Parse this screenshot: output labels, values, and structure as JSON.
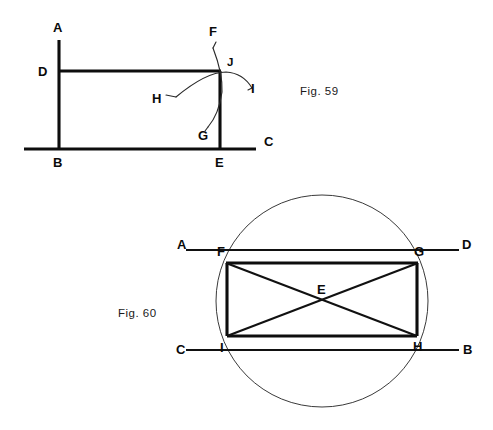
{
  "page": {
    "background_color": "#ffffff",
    "ink_color": "#0d0d0d",
    "width": 493,
    "height": 430
  },
  "figures": [
    {
      "id": "fig-59",
      "caption": "Fig. 59",
      "caption_x": 300,
      "caption_y": 95,
      "description": "Rectangle construction with two intersecting compass arcs meeting at J",
      "points": [
        {
          "key": "A",
          "label": "A",
          "x": 59,
          "y": 40,
          "label_x": 53,
          "label_y": 32
        },
        {
          "key": "B",
          "label": "B",
          "x": 59,
          "y": 149,
          "label_x": 53,
          "label_y": 167
        },
        {
          "key": "C",
          "label": "C",
          "x": 256,
          "y": 149,
          "label_x": 264,
          "label_y": 146
        },
        {
          "key": "D",
          "label": "D",
          "x": 59,
          "y": 71,
          "label_x": 38,
          "label_y": 76
        },
        {
          "key": "E",
          "label": "E",
          "x": 220,
          "y": 149,
          "label_x": 215,
          "label_y": 167
        },
        {
          "key": "F",
          "label": "F",
          "x": 216,
          "y": 42,
          "label_x": 209,
          "label_y": 36
        },
        {
          "key": "G",
          "label": "G",
          "x": 207,
          "y": 127,
          "label_x": 198,
          "label_y": 140
        },
        {
          "key": "H",
          "label": "H",
          "x": 166,
          "y": 89,
          "label_x": 152,
          "label_y": 103
        },
        {
          "key": "I",
          "label": "I",
          "x": 247,
          "y": 95,
          "label_x": 251,
          "label_y": 93
        },
        {
          "key": "J",
          "label": "J",
          "x": 220,
          "y": 71,
          "label_x": 227,
          "label_y": 66
        }
      ],
      "segments": [
        {
          "name": "vertical-line-AB",
          "from": "A",
          "to": "B",
          "weight": "heavy"
        },
        {
          "name": "base-line-BC",
          "from": "B",
          "to": "C",
          "weight": "heavy"
        },
        {
          "name": "top-line-DJ",
          "from": "D",
          "to": "J",
          "weight": "heavy"
        },
        {
          "name": "vertical-line-JE",
          "from": "J",
          "to": "E",
          "weight": "heavy"
        }
      ],
      "arcs": [
        {
          "name": "arc-H-J-I",
          "description": "arc swung from H through J out to I",
          "path": "M 176 97 Q 206 72 226 72 Q 243 73 252 88",
          "weight": "thin"
        },
        {
          "name": "arc-F-J-G",
          "description": "arc swung from F down through J to G",
          "path": "M 213 48 Q 223 74 222 92 Q 219 114 208 127",
          "weight": "thin"
        }
      ]
    },
    {
      "id": "fig-60",
      "caption": "Fig. 60",
      "caption_x": 118,
      "caption_y": 317,
      "description": "Circle with inscribed rectangle FGHI, diagonals crossing at centre E, with chords extended to A-D and C-B",
      "circle": {
        "cx": 322,
        "cy": 301,
        "r": 106
      },
      "points": [
        {
          "key": "A",
          "label": "A",
          "x": 186,
          "y": 250,
          "label_x": 177,
          "label_y": 249
        },
        {
          "key": "B",
          "label": "B",
          "x": 459,
          "y": 350,
          "label_x": 463,
          "label_y": 354
        },
        {
          "key": "C",
          "label": "C",
          "x": 186,
          "y": 350,
          "label_x": 176,
          "label_y": 354
        },
        {
          "key": "D",
          "label": "D",
          "x": 459,
          "y": 250,
          "label_x": 462,
          "label_y": 249
        },
        {
          "key": "E",
          "label": "E",
          "x": 322,
          "y": 300,
          "label_x": 317,
          "label_y": 294
        },
        {
          "key": "F",
          "label": "F",
          "x": 226,
          "y": 263,
          "label_x": 217,
          "label_y": 256
        },
        {
          "key": "G",
          "label": "G",
          "x": 418,
          "y": 263,
          "label_x": 414,
          "label_y": 256
        },
        {
          "key": "H",
          "label": "H",
          "x": 417,
          "y": 336,
          "label_x": 413,
          "label_y": 351
        },
        {
          "key": "I",
          "label": "I",
          "x": 227,
          "y": 336,
          "label_x": 220,
          "label_y": 352
        }
      ],
      "segments": [
        {
          "name": "rect-top-FG",
          "from": "F",
          "to": "G",
          "weight": "heavy"
        },
        {
          "name": "rect-right-GH",
          "from": "G",
          "to": "H",
          "weight": "heavy"
        },
        {
          "name": "rect-bottom-HI",
          "from": "H",
          "to": "I",
          "weight": "heavy"
        },
        {
          "name": "rect-left-IF",
          "from": "I",
          "to": "F",
          "weight": "heavy"
        },
        {
          "name": "diagonal-FH",
          "from": "F",
          "to": "H",
          "weight": "medium"
        },
        {
          "name": "diagonal-IG",
          "from": "I",
          "to": "G",
          "weight": "medium"
        },
        {
          "name": "line-A-to-D",
          "from": "A",
          "to": "D",
          "weight": "medium"
        },
        {
          "name": "line-C-to-B",
          "from": "C",
          "to": "B",
          "weight": "medium"
        }
      ]
    }
  ]
}
